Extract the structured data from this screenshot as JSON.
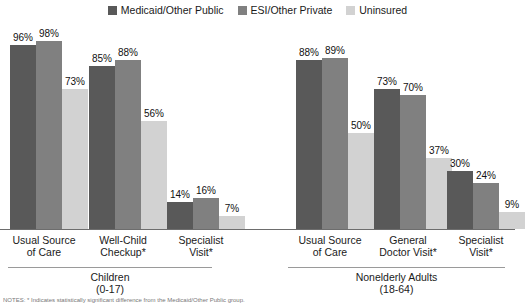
{
  "legend": {
    "entries": [
      {
        "label": "Medicaid/Other Public",
        "color": "#595959",
        "icon": "legend-swatch-icon"
      },
      {
        "label": "ESI/Other Private",
        "color": "#808080",
        "icon": "legend-swatch-icon"
      },
      {
        "label": "Uninsured",
        "color": "#d2d2d2",
        "icon": "legend-swatch-icon"
      }
    ]
  },
  "footnote": {
    "text": "NOTES: * Indicates statistically significant difference from the Medicaid/Other Public group."
  },
  "chart_data": {
    "type": "bar",
    "title": "",
    "xlabel": "",
    "ylabel": "",
    "ylim": [
      0,
      100
    ],
    "grid": false,
    "legend_position": "top-center",
    "series": [
      {
        "name": "Medicaid/Other Public",
        "color": "#595959",
        "values": [
          96,
          85,
          14,
          88,
          73,
          30
        ]
      },
      {
        "name": "ESI/Other Private",
        "color": "#808080",
        "values": [
          98,
          88,
          16,
          89,
          70,
          24
        ]
      },
      {
        "name": "Uninsured",
        "color": "#d2d2d2",
        "values": [
          73,
          56,
          7,
          50,
          37,
          9
        ]
      }
    ],
    "categories": [
      "Usual Source of Care",
      "Well-Child Checkup*",
      "Specialist Visit*",
      "Usual Source of Care",
      "General Doctor Visit*",
      "Specialist Visit*"
    ],
    "sections": [
      {
        "label": "Children\n(0-17)",
        "categories": [
          0,
          1,
          2
        ]
      },
      {
        "label": "Nonelderly Adults\n(18-64)",
        "categories": [
          3,
          4,
          5
        ]
      }
    ]
  },
  "groups": [
    {
      "id": "children-usual-source",
      "label": "Usual Source\nof Care",
      "left": 10,
      "label_left": -8,
      "label_width": 104,
      "bars": [
        {
          "series": "Medicaid/Other Public",
          "value": 96,
          "value_label": "96%",
          "color": "#595959"
        },
        {
          "series": "ESI/Other Private",
          "value": 98,
          "value_label": "98%",
          "color": "#808080"
        },
        {
          "series": "Uninsured",
          "value": 73,
          "value_label": "73%",
          "color": "#d2d2d2"
        }
      ]
    },
    {
      "id": "children-well-child-checkup",
      "label": "Well-Child\nCheckup*",
      "left": 89,
      "label_left": 71,
      "label_width": 104,
      "bars": [
        {
          "series": "Medicaid/Other Public",
          "value": 85,
          "value_label": "85%",
          "color": "#595959"
        },
        {
          "series": "ESI/Other Private",
          "value": 88,
          "value_label": "88%",
          "color": "#808080"
        },
        {
          "series": "Uninsured",
          "value": 56,
          "value_label": "56%",
          "color": "#d2d2d2"
        }
      ]
    },
    {
      "id": "children-specialist-visit",
      "label": "Specialist\nVisit*",
      "left": 167,
      "label_left": 149,
      "label_width": 104,
      "bars": [
        {
          "series": "Medicaid/Other Public",
          "value": 14,
          "value_label": "14%",
          "color": "#595959"
        },
        {
          "series": "ESI/Other Private",
          "value": 16,
          "value_label": "16%",
          "color": "#808080"
        },
        {
          "series": "Uninsured",
          "value": 7,
          "value_label": "7%",
          "color": "#d2d2d2"
        }
      ]
    },
    {
      "id": "adults-usual-source",
      "label": "Usual Source\nof Care",
      "left": 296,
      "label_left": 278,
      "label_width": 104,
      "bars": [
        {
          "series": "Medicaid/Other Public",
          "value": 88,
          "value_label": "88%",
          "color": "#595959"
        },
        {
          "series": "ESI/Other Private",
          "value": 89,
          "value_label": "89%",
          "color": "#808080"
        },
        {
          "series": "Uninsured",
          "value": 50,
          "value_label": "50%",
          "color": "#d2d2d2"
        }
      ]
    },
    {
      "id": "adults-general-doctor-visit",
      "label": "General\nDoctor Visit*",
      "left": 374,
      "label_left": 356,
      "label_width": 104,
      "bars": [
        {
          "series": "Medicaid/Other Public",
          "value": 73,
          "value_label": "73%",
          "color": "#595959"
        },
        {
          "series": "ESI/Other Private",
          "value": 70,
          "value_label": "70%",
          "color": "#808080"
        },
        {
          "series": "Uninsured",
          "value": 37,
          "value_label": "37%",
          "color": "#d2d2d2"
        }
      ]
    },
    {
      "id": "adults-specialist-visit",
      "label": "Specialist\nVisit*",
      "left": 447,
      "label_left": 429,
      "label_width": 104,
      "bars": [
        {
          "series": "Medicaid/Other Public",
          "value": 30,
          "value_label": "30%",
          "color": "#595959"
        },
        {
          "series": "ESI/Other Private",
          "value": 24,
          "value_label": "24%",
          "color": "#808080"
        },
        {
          "series": "Uninsured",
          "value": 9,
          "value_label": "9%",
          "color": "#d2d2d2"
        }
      ]
    }
  ],
  "sections": [
    {
      "id": "children",
      "label": "Children\n(0-17)",
      "rule_left": 8,
      "rule_width": 204,
      "label_left": 8,
      "label_width": 204
    },
    {
      "id": "nonelderly-adults",
      "label": "Nonelderly Adults\n(18-64)",
      "rule_left": 288,
      "rule_width": 217,
      "label_left": 288,
      "label_width": 217
    }
  ]
}
